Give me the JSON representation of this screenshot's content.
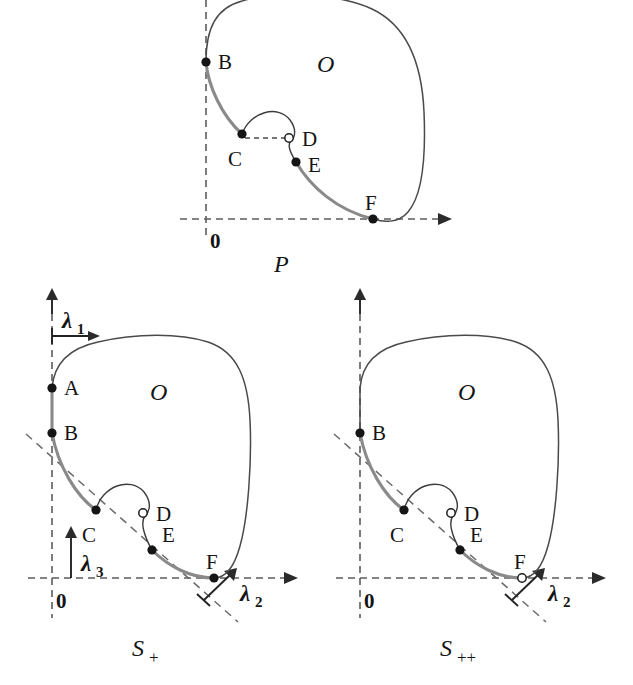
{
  "figure": {
    "colors": {
      "curve_gray": "#8a8a8a",
      "outline": "#4a4a4a",
      "axis": "#232323",
      "dot": "#151515",
      "background": "#ffffff"
    }
  },
  "panels": [
    {
      "id": "top",
      "caption": "P",
      "caption_sub": "",
      "region_label": "O",
      "points": [
        {
          "label": "B",
          "type": "filled"
        },
        {
          "label": "C",
          "type": "filled"
        },
        {
          "label": "D",
          "type": "open"
        },
        {
          "label": "E",
          "type": "filled"
        },
        {
          "label": "F",
          "type": "filled"
        }
      ],
      "origin_label": "0",
      "axes": [],
      "has_diagonal": false,
      "has_cd_dash": true
    },
    {
      "id": "s-plus",
      "caption": "S",
      "caption_sub": "+",
      "region_label": "O",
      "points": [
        {
          "label": "A",
          "type": "filled"
        },
        {
          "label": "B",
          "type": "filled"
        },
        {
          "label": "C",
          "type": "filled"
        },
        {
          "label": "D",
          "type": "open"
        },
        {
          "label": "E",
          "type": "filled"
        },
        {
          "label": "F",
          "type": "filled"
        }
      ],
      "origin_label": "0",
      "axes": [
        {
          "name": "lambda1",
          "symbol": "λ",
          "sub": "1",
          "direction": "horizontal"
        },
        {
          "name": "lambda3",
          "symbol": "λ",
          "sub": "3",
          "direction": "vertical"
        },
        {
          "name": "lambda2",
          "symbol": "λ",
          "sub": "2",
          "direction": "diagonal"
        }
      ],
      "has_diagonal": true,
      "has_cd_dash": false
    },
    {
      "id": "s-plus-plus",
      "caption": "S",
      "caption_sub": "++",
      "region_label": "O",
      "points": [
        {
          "label": "B",
          "type": "filled"
        },
        {
          "label": "C",
          "type": "filled"
        },
        {
          "label": "D",
          "type": "open"
        },
        {
          "label": "E",
          "type": "filled"
        },
        {
          "label": "F",
          "type": "open"
        }
      ],
      "origin_label": "0",
      "axes": [
        {
          "name": "lambda2",
          "symbol": "λ",
          "sub": "2",
          "direction": "diagonal"
        }
      ],
      "has_diagonal": true,
      "has_cd_dash": false
    }
  ],
  "labels": {
    "A": "A",
    "B": "B",
    "C": "C",
    "D": "D",
    "E": "E",
    "F": "F",
    "O": "O",
    "zero": "0",
    "P": "P",
    "S": "S",
    "plus": "+",
    "plusplus": "++",
    "lambda": "λ",
    "one": "1",
    "two": "2",
    "three": "3"
  }
}
